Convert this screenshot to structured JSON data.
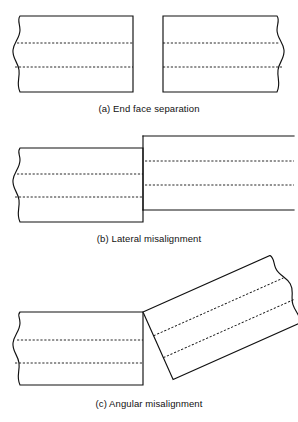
{
  "figure": {
    "background_color": "#ffffff",
    "line_color": "#111111",
    "fill_color": "#ffffff",
    "width": 298,
    "height": 422
  },
  "panels": [
    {
      "id": "a",
      "caption": "(a) End face separation",
      "description": "Two coaxial fiber ends separated by an axial gap",
      "elements": {
        "left_fiber_label": "left fiber",
        "right_fiber_label": "right fiber",
        "gap_label": "end face separation gap"
      },
      "geometry": {
        "left_fiber": {
          "top_y": 16,
          "bottom_y": 92,
          "face_x": 133,
          "break_x": 12,
          "core_lines_y": [
            43,
            67
          ]
        },
        "right_fiber": {
          "top_y": 16,
          "bottom_y": 92,
          "face_x": 163,
          "break_x": 286,
          "core_lines_y": [
            43,
            67
          ]
        },
        "gap_x_range": [
          133,
          163
        ]
      }
    },
    {
      "id": "b",
      "caption": "(b) Lateral misalignment",
      "description": "Two fiber ends in contact but offset perpendicular to the axis",
      "elements": {
        "left_fiber_label": "left fiber",
        "right_fiber_label": "right fiber offset upward",
        "offset_label": "lateral offset"
      },
      "geometry": {
        "left_fiber": {
          "top_y": 23,
          "bottom_y": 97,
          "face_x": 143,
          "break_x": 12,
          "core_lines_y": [
            49,
            72
          ]
        },
        "right_fiber": {
          "top_y": 11,
          "bottom_y": 85,
          "face_x": 143,
          "end_x": 292,
          "core_lines_y": [
            36,
            60
          ]
        },
        "offset_px": 12
      }
    },
    {
      "id": "c",
      "caption": "(c) Angular misalignment",
      "description": "Two fiber ends meeting at an angle, the right fiber rotated about the joint",
      "elements": {
        "left_fiber_label": "left fiber",
        "right_fiber_label": "right fiber rotated counter-clockwise",
        "angle_label": "angular tilt"
      },
      "geometry": {
        "left_fiber": {
          "top_y": 57,
          "bottom_y": 130,
          "face_x": 143,
          "break_x": 12,
          "core_lines_y": [
            85,
            108
          ]
        },
        "right_fiber": {
          "pivot": [
            143,
            57
          ],
          "tilt_degrees": -24,
          "length": 150,
          "thickness": 74,
          "core_offsets": [
            26,
            50
          ]
        }
      }
    }
  ]
}
